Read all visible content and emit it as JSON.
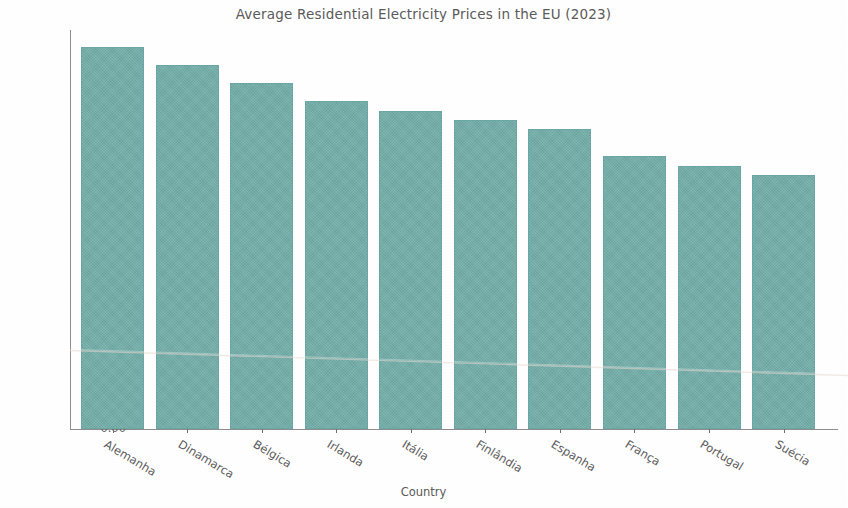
{
  "chart_data": {
    "type": "bar",
    "title": "Average Residential Electricity Prices in the EU (2023)",
    "xlabel": "Country",
    "ylabel": "€/kWh",
    "categories": [
      "Alemanha",
      "Dinamarca",
      "Bélgica",
      "Irlanda",
      "Itália",
      "Finlândia",
      "Espanha",
      "França",
      "Portugal",
      "Suécia"
    ],
    "values": [
      0.42,
      0.4,
      0.38,
      0.36,
      0.35,
      0.34,
      0.33,
      0.3,
      0.289,
      0.279
    ],
    "ylim": [
      0.0,
      0.4385
    ],
    "yticks": [
      0.0,
      0.05,
      0.1,
      0.15,
      0.2,
      0.25,
      0.3,
      0.35,
      0.4
    ],
    "ytick_labels": [
      "0.00",
      "0.05",
      "0.10",
      "0.15",
      "0.20",
      "0.25",
      "0.30",
      "0.35",
      "0.40"
    ],
    "grid": false,
    "legend": null,
    "bar_color": "#74afab",
    "bar_edge_color": "#6aa7a4",
    "text_color": "#5a5a5a",
    "axis_color": "#8d8d8d",
    "background_color": "#fefefe"
  }
}
